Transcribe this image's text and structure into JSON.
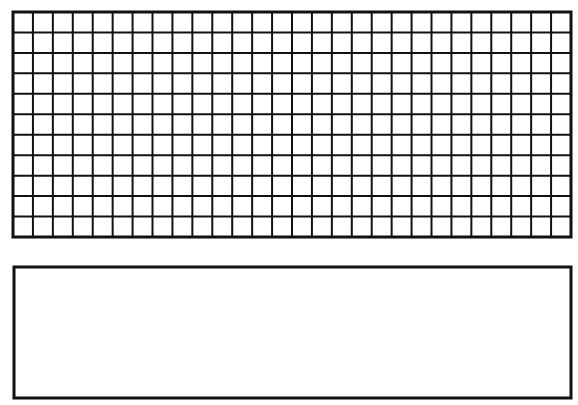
{
  "figure": {
    "background": "#ffffff",
    "stroke_color": "#111111",
    "grid": {
      "columns": 28,
      "rows": 11,
      "x": 13,
      "y": 12,
      "width": 558,
      "height": 225,
      "line_width": 2,
      "border_width": 3
    },
    "blank_box": {
      "x": 14,
      "y": 267,
      "width": 557,
      "height": 131,
      "border_width": 3
    }
  }
}
